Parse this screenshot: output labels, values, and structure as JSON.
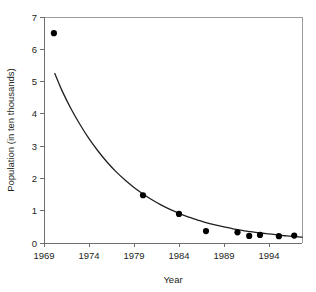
{
  "chart_data": {
    "type": "scatter",
    "title": "",
    "xlabel": "Year",
    "ylabel": "Population (in ten thousands)",
    "xlim": [
      1969,
      1998
    ],
    "ylim": [
      0,
      7
    ],
    "xticks": [
      1969,
      1974,
      1979,
      1984,
      1989,
      1994
    ],
    "xtick_labels": [
      "1969",
      "1974",
      "1979",
      "1984",
      "1989",
      "1994"
    ],
    "yticks": [
      0,
      1,
      2,
      3,
      4,
      5,
      6,
      7
    ],
    "ytick_labels": [
      "0",
      "1",
      "2",
      "3",
      "4",
      "5",
      "6",
      "7"
    ],
    "grid": false,
    "legend": "none",
    "points": [
      {
        "x": 1970.1,
        "y": 6.5
      },
      {
        "x": 1980.0,
        "y": 1.48
      },
      {
        "x": 1984.0,
        "y": 0.9
      },
      {
        "x": 1987.0,
        "y": 0.37
      },
      {
        "x": 1990.5,
        "y": 0.33
      },
      {
        "x": 1991.8,
        "y": 0.22
      },
      {
        "x": 1993.0,
        "y": 0.25
      },
      {
        "x": 1995.1,
        "y": 0.21
      },
      {
        "x": 1996.8,
        "y": 0.23
      }
    ],
    "series": [
      {
        "name": "exponential-decay-fit",
        "type": "line",
        "x": [
          1970.2,
          1971,
          1972,
          1973,
          1974,
          1975,
          1976,
          1977,
          1978,
          1979,
          1980,
          1981,
          1982,
          1983,
          1984,
          1985,
          1986,
          1987,
          1988,
          1989,
          1990,
          1991,
          1992,
          1993,
          1994,
          1995,
          1996,
          1997,
          1997.7
        ],
        "y": [
          5.25,
          4.72,
          4.16,
          3.67,
          3.23,
          2.85,
          2.51,
          2.21,
          1.95,
          1.72,
          1.52,
          1.34,
          1.18,
          1.04,
          0.92,
          0.81,
          0.72,
          0.63,
          0.56,
          0.5,
          0.44,
          0.39,
          0.35,
          0.31,
          0.28,
          0.25,
          0.22,
          0.2,
          0.18
        ]
      }
    ],
    "marker_color": "#000000",
    "curve_color": "#231f20",
    "axis_color": "#6d6e71",
    "background_color": "#ffffff"
  },
  "geometry": {
    "plot_left": 44,
    "plot_right": 302,
    "plot_top": 17,
    "plot_bottom": 243,
    "x_per_year": 9.0,
    "y_per_unit": 32.28,
    "marker_radius": 3.1
  }
}
